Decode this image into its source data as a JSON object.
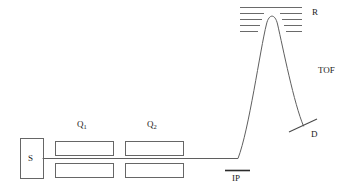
{
  "figure": {
    "name": "reflectron-time-of-flight-mass-spectrometer-schematic",
    "background_color": "#ffffff",
    "stroke_color": "#555555",
    "text_color": "#1a1a1a",
    "width": 352,
    "height": 193
  },
  "labels": {
    "source": "S",
    "quadrupole_1_main": "Q",
    "quadrupole_1_sub": "1",
    "quadrupole_2_main": "Q",
    "quadrupole_2_sub": "2",
    "interaction_point": "IP",
    "reflectron": "R",
    "time_of_flight": "TOF",
    "detector": "D"
  },
  "components": {
    "source_box": {
      "x": 20,
      "y": 138,
      "width": 23,
      "height": 40
    },
    "quadrupole_1": {
      "upper_plate": {
        "x": 55,
        "y": 141,
        "width": 58,
        "height": 14
      },
      "lower_plate": {
        "x": 55,
        "y": 163,
        "width": 58,
        "height": 14
      }
    },
    "quadrupole_2": {
      "upper_plate": {
        "x": 125,
        "y": 141,
        "width": 58,
        "height": 14
      },
      "lower_plate": {
        "x": 125,
        "y": 163,
        "width": 58,
        "height": 14
      }
    },
    "interaction_point_bar": {
      "x1": 225,
      "y1": 170,
      "x2": 250,
      "y2": 170
    },
    "detector_bar": {
      "x1": 289,
      "y1": 132,
      "x2": 317,
      "y2": 119
    },
    "reflectron_grid": {
      "left_segments": 5,
      "right_segments": 5,
      "top_line": {
        "x1": 240,
        "y1": 7,
        "x2": 302,
        "y2": 7
      },
      "row_spacing": 6,
      "left_x1": 240,
      "left_x2": 265,
      "right_x1": 279,
      "right_x2": 302
    }
  },
  "beam": {
    "axis_start": {
      "x": 43,
      "y": 158
    },
    "bend_point": {
      "x": 238,
      "y": 158
    },
    "apex": {
      "x": 272,
      "y": 15
    },
    "end_at_detector": {
      "x": 303,
      "y": 126
    }
  }
}
